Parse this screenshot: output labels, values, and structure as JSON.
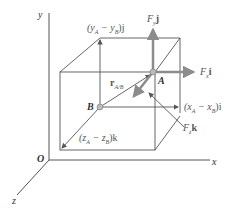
{
  "figure": {
    "axes": {
      "x": "x",
      "y": "y",
      "z": "z",
      "origin": "O"
    },
    "points": {
      "A": "A",
      "B": "B"
    },
    "labels": {
      "fy": "F",
      "fy_sub": "y",
      "fy_unit": "j",
      "fx": "F",
      "fx_sub": "x",
      "fx_unit": "i",
      "fz": "F",
      "fz_sub": "z",
      "fz_unit": "k",
      "r": "r",
      "r_sub": "A/B",
      "dy": "(y",
      "dy_a": "A",
      "dy_mid": " − y",
      "dy_b": "B",
      "dy_end": ")j",
      "dx": "(x",
      "dx_a": "A",
      "dx_mid": " − x",
      "dx_b": "B",
      "dx_end": ")i",
      "dz": "(z",
      "dz_a": "A",
      "dz_mid": " − z",
      "dz_b": "B",
      "dz_end": ")k"
    },
    "colors": {
      "line": "#555555",
      "force_arrow": "#8c8c8c",
      "text": "#444444",
      "point": "#aaaaaa"
    }
  }
}
